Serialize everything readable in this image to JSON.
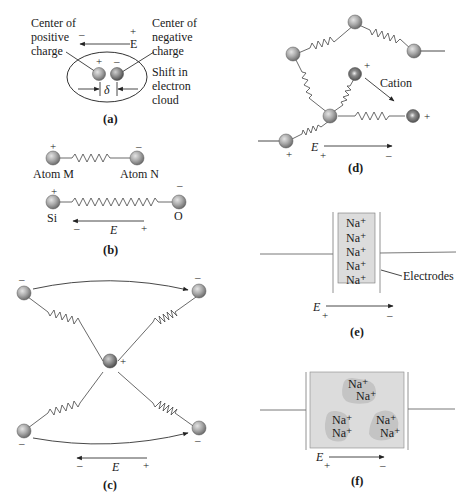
{
  "figure": {
    "panels": {
      "a": {
        "caption": "(a)",
        "label_positive_center": [
          "Center of",
          "positive",
          "charge"
        ],
        "label_negative_center": [
          "Center of",
          "negative",
          "charge"
        ],
        "label_shift": [
          "Shift in",
          "electron",
          "cloud"
        ],
        "field_label": "E",
        "field_minus": "–",
        "field_plus": "+",
        "delta": "δ",
        "atom_plus": "+",
        "atom_minus": "–"
      },
      "b": {
        "caption": "(b)",
        "atom_m": "Atom M",
        "atom_n": "Atom N",
        "atom_si": "Si",
        "atom_o": "O",
        "plus": "+",
        "minus": "–",
        "field_label": "E",
        "field_minus": "–",
        "field_plus": "+"
      },
      "c": {
        "caption": "(c)",
        "center_plus": "+",
        "minus": "–",
        "field_label": "E",
        "field_minus": "–",
        "field_plus": "+"
      },
      "d": {
        "caption": "(d)",
        "cation_label": "Cation",
        "plus": "+",
        "field_label": "E",
        "field_plus": "+",
        "field_minus": "–"
      },
      "e": {
        "caption": "(e)",
        "ions": [
          "Na⁺",
          "Na⁺",
          "Na⁺",
          "Na⁺",
          "Na⁺"
        ],
        "electrodes_label": "Electrodes",
        "field_label": "E",
        "field_plus": "+",
        "field_minus": "–"
      },
      "f": {
        "caption": "(f)",
        "ions": [
          "Na⁺",
          "Na⁺",
          "Na⁺",
          "Na⁺",
          "Na⁺",
          "Na⁺"
        ],
        "field_label": "E",
        "field_plus": "+",
        "field_minus": "–"
      }
    },
    "colors": {
      "atom_fill": "#9a9a9a",
      "atom_highlight": "#d8d8d8",
      "cation_fill": "#7a7a7a",
      "electrolyte_fill": "#dcdcdc",
      "cluster_fill": "#c4c4c4",
      "line": "#333333"
    }
  }
}
